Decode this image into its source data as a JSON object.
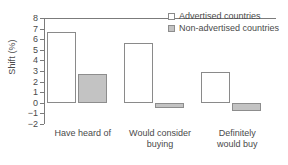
{
  "chart_data": {
    "type": "bar",
    "title": "",
    "xlabel": "",
    "ylabel": "Shift (%)",
    "ylim": [
      -2,
      8
    ],
    "yticks": [
      8,
      7,
      6,
      5,
      4,
      3,
      2,
      1,
      0,
      -1,
      -2
    ],
    "ytick_labels": [
      "8",
      "7",
      "6",
      "5",
      "4",
      "3",
      "2",
      "1",
      "0",
      "-1",
      "-2"
    ],
    "grid": false,
    "legend_position": "top-right",
    "categories": [
      "Have heard of",
      "Would consider\nbuying",
      "Definitely\nwould buy"
    ],
    "series": [
      {
        "name": "Advertised countries",
        "color": "#ffffff",
        "edge_color": "#8a8a8a",
        "values": [
          6.7,
          5.6,
          2.9
        ]
      },
      {
        "name": "Non-advertised countries",
        "color": "#c3c3c3",
        "edge_color": "#8d8d8d",
        "values": [
          2.7,
          -0.45,
          -0.75
        ]
      }
    ]
  },
  "legend": {
    "items": [
      {
        "label": "Advertised countries"
      },
      {
        "label": "Non-advertised countries"
      }
    ]
  },
  "axis": {
    "y_title": "Shift (%)"
  }
}
